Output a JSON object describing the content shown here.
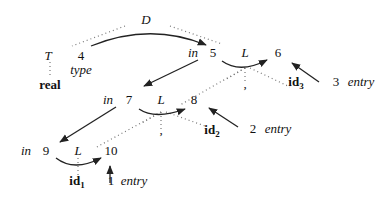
{
  "diagram": {
    "nodes": {
      "D": "D",
      "T": "T",
      "real": "real",
      "n4": "4",
      "type": "type",
      "in5": "in",
      "n5": "5",
      "L1": "L",
      "n6": "6",
      "comma1": ",",
      "id3": "id",
      "id3_sub": "3",
      "n3": "3",
      "entry3": "entry",
      "in7": "in",
      "n7": "7",
      "L2": "L",
      "n8": "8",
      "comma2": ",",
      "id2": "id",
      "id2_sub": "2",
      "n2": "2",
      "entry2": "entry",
      "in9": "in",
      "n9": "9",
      "L3": "L",
      "n10": "10",
      "id1": "id",
      "id1_sub": "1",
      "n1": "1",
      "entry1": "entry"
    }
  }
}
